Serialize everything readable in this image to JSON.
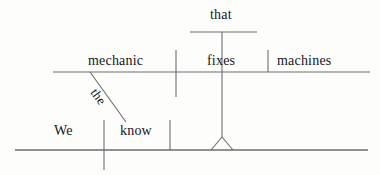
{
  "diagram": {
    "type": "reed-kellogg-sentence-diagram",
    "sentence": "We know the mechanic that fixes machines.",
    "line_color": "#6d6d70",
    "text_color": "#16161a",
    "background_color": "#fdfdfc",
    "main_clause": {
      "subject": "We",
      "verb": "know",
      "direct_object_note": "noun clause on pedestal"
    },
    "relative_clause": {
      "subject": "mechanic",
      "verb": "fixes",
      "direct_object": "machines",
      "relative_pronoun": "that",
      "article_modifier": "the"
    },
    "words": {
      "that": "that",
      "mechanic": "mechanic",
      "the": "the",
      "fixes": "fixes",
      "machines": "machines",
      "we": "We",
      "know": "know"
    }
  }
}
